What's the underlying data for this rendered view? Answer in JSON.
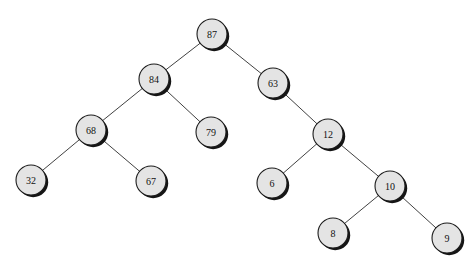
{
  "diagram": {
    "type": "binary-tree",
    "background_color": "#ffffff",
    "node_fill_color": "#e4e4e4",
    "node_stroke_color": "#1c1c1c",
    "node_shadow_color": "#151515",
    "edge_color": "#2b2b2b",
    "node_radius": 15,
    "nodes": [
      {
        "id": "n87",
        "label": "87",
        "cx": 212,
        "cy": 34
      },
      {
        "id": "n84",
        "label": "84",
        "cx": 154,
        "cy": 79
      },
      {
        "id": "n63",
        "label": "63",
        "cx": 273,
        "cy": 83
      },
      {
        "id": "n68",
        "label": "68",
        "cx": 91,
        "cy": 130
      },
      {
        "id": "n79",
        "label": "79",
        "cx": 211,
        "cy": 132
      },
      {
        "id": "n12",
        "label": "12",
        "cx": 328,
        "cy": 134
      },
      {
        "id": "n32",
        "label": "32",
        "cx": 31,
        "cy": 180
      },
      {
        "id": "n67",
        "label": "67",
        "cx": 151,
        "cy": 181
      },
      {
        "id": "n6",
        "label": "6",
        "cx": 272,
        "cy": 183
      },
      {
        "id": "n10",
        "label": "10",
        "cx": 390,
        "cy": 186
      },
      {
        "id": "n8",
        "label": "8",
        "cx": 333,
        "cy": 233
      },
      {
        "id": "n9",
        "label": "9",
        "cx": 447,
        "cy": 238
      }
    ],
    "edges": [
      {
        "from": "n87",
        "to": "n84",
        "side": "left"
      },
      {
        "from": "n87",
        "to": "n63",
        "side": "right"
      },
      {
        "from": "n84",
        "to": "n68",
        "side": "left"
      },
      {
        "from": "n84",
        "to": "n79",
        "side": "right"
      },
      {
        "from": "n68",
        "to": "n32",
        "side": "left"
      },
      {
        "from": "n68",
        "to": "n67",
        "side": "right"
      },
      {
        "from": "n63",
        "to": "n12",
        "side": "right"
      },
      {
        "from": "n12",
        "to": "n6",
        "side": "left"
      },
      {
        "from": "n12",
        "to": "n10",
        "side": "right"
      },
      {
        "from": "n10",
        "to": "n8",
        "side": "left"
      },
      {
        "from": "n10",
        "to": "n9",
        "side": "right"
      }
    ]
  }
}
